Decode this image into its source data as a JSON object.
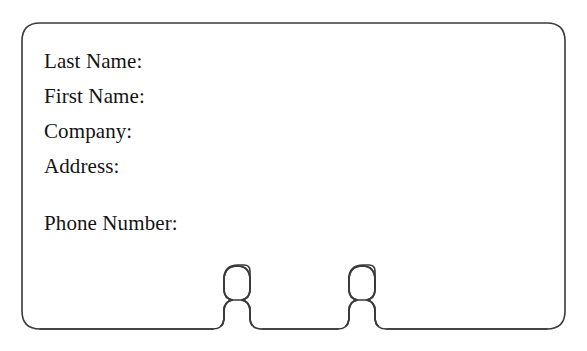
{
  "document": {
    "type": "form-card",
    "title": "Contact Information Card",
    "background_color": "#ffffff",
    "outline_color": "#3a3a3a",
    "text_color": "#141414"
  },
  "card": {
    "name": "contact-form-card",
    "corner_radius": 18,
    "stroke_width": 1.6,
    "bounds": {
      "left": 22,
      "top": 23,
      "right": 565,
      "bottom": 329
    }
  },
  "fields": [
    {
      "label": "Last Name:",
      "value": "",
      "gap_before": false
    },
    {
      "label": "First Name:",
      "value": "",
      "gap_before": false
    },
    {
      "label": "Company:",
      "value": "",
      "gap_before": false
    },
    {
      "label": "Address:",
      "value": "",
      "gap_before": false
    },
    {
      "label": "Phone Number:",
      "value": "",
      "gap_before": true
    }
  ],
  "tabs": [
    {
      "name": "left-tab",
      "bulb_left": 215,
      "bulb_right": 250,
      "bulb_top": 265,
      "neck_bottom": 329
    },
    {
      "name": "right-tab",
      "bulb_left": 340,
      "bulb_right": 375,
      "bulb_top": 265,
      "neck_bottom": 329
    }
  ]
}
